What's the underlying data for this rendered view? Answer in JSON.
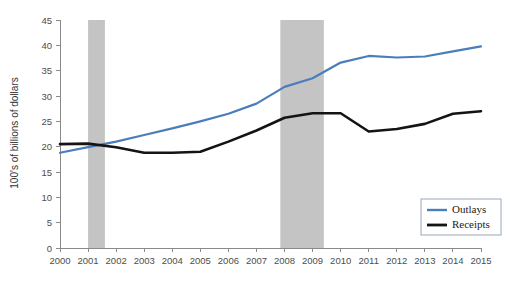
{
  "chart_data": {
    "type": "line",
    "title": "",
    "subtitle": "",
    "xlabel": "",
    "ylabel": "100's of billions of dollars",
    "x": [
      2000,
      2001,
      2002,
      2003,
      2004,
      2005,
      2006,
      2007,
      2008,
      2009,
      2010,
      2011,
      2012,
      2013,
      2014,
      2015
    ],
    "categories": [
      "2000",
      "2001",
      "2002",
      "2003",
      "2004",
      "2005",
      "2006",
      "2007",
      "2008",
      "2009",
      "2010",
      "2011",
      "2012",
      "2013",
      "2014",
      "2015"
    ],
    "series": [
      {
        "name": "Outlays",
        "color": "#4A7EBB",
        "values": [
          18.8,
          19.9,
          21.0,
          22.3,
          23.6,
          25.0,
          26.5,
          28.5,
          31.8,
          33.5,
          36.6,
          37.9,
          37.6,
          37.8,
          38.8,
          39.8
        ]
      },
      {
        "name": "Receipts",
        "color": "#141414",
        "values": [
          20.5,
          20.6,
          19.9,
          18.8,
          18.8,
          19.0,
          21.0,
          23.2,
          25.7,
          26.6,
          26.6,
          23.0,
          23.5,
          24.5,
          26.5,
          27.0
        ]
      }
    ],
    "receipts_extended": [
      20.5,
      20.6,
      19.9,
      18.8,
      18.8,
      19.0,
      21.0,
      23.2,
      25.7,
      26.6,
      26.6,
      23.0,
      23.5,
      24.5,
      26.5,
      27.0,
      29.4,
      31.8,
      34.0
    ],
    "xlim": [
      2000,
      2015
    ],
    "ylim": [
      0,
      45
    ],
    "yticks": [
      0,
      5,
      10,
      15,
      20,
      25,
      30,
      35,
      40,
      45
    ],
    "xticks": [
      "2000",
      "2001",
      "2002",
      "2003",
      "2004",
      "2005",
      "2006",
      "2007",
      "2008",
      "2009",
      "2010",
      "2011",
      "2012",
      "2013",
      "2014",
      "2015"
    ],
    "grid": false,
    "legend_position": "bottom-right",
    "legend_entries": [
      {
        "label": "Outlays",
        "color": "#4A7EBB"
      },
      {
        "label": "Receipts",
        "color": "#141414"
      }
    ],
    "annotations": [
      {
        "type": "recession-band",
        "label": "2001 recession",
        "x_start": 2001.0,
        "x_end": 2001.6,
        "color": "#c4c4c4"
      },
      {
        "type": "recession-band",
        "label": "2008-2009 recession",
        "x_start": 2007.85,
        "x_end": 2009.4,
        "color": "#c4c4c4"
      }
    ]
  },
  "axis": {
    "y_title": "100's of billions of dollars",
    "y_tick_labels": [
      "45",
      "40",
      "35",
      "30",
      "25",
      "20",
      "15",
      "10",
      "5",
      "0"
    ],
    "x_tick_labels": [
      "2000",
      "2001",
      "2002",
      "2003",
      "2004",
      "2005",
      "2006",
      "2007",
      "2008",
      "2009",
      "2010",
      "2011",
      "2012",
      "2013",
      "2014",
      "2015"
    ]
  },
  "legend": {
    "items": [
      {
        "label": "Outlays"
      },
      {
        "label": "Receipts"
      }
    ]
  },
  "colors": {
    "outlays": "#4A7EBB",
    "receipts": "#141414",
    "recession_band": "#c4c4c4",
    "axis": "#8a8a8a",
    "background": "#ffffff"
  }
}
